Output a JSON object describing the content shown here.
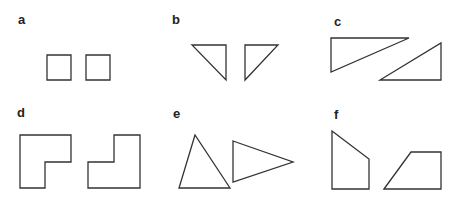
{
  "panels": [
    {
      "label": "a",
      "label_pos": [
        18,
        24
      ],
      "shapes": [
        "47,55 71,55 71,80 47,80",
        "86,55 110,55 110,80 86,80"
      ]
    },
    {
      "label": "b",
      "label_pos": [
        172,
        24
      ],
      "shapes": [
        "192,45 226,45 226,80",
        "245,45 278,45 245,80"
      ]
    },
    {
      "label": "c",
      "label_pos": [
        334,
        26
      ],
      "shapes": [
        "331,38 409,38 331,72",
        "380,80 441,80 441,43"
      ]
    },
    {
      "label": "d",
      "label_pos": [
        17,
        117
      ],
      "shapes": [
        "20,135 71,135 71,162 45,162 45,188 20,188",
        "88,162 114,162 114,135 140,135 140,188 88,188"
      ]
    },
    {
      "label": "e",
      "label_pos": [
        173,
        118
      ],
      "shapes": [
        "195,135 179,188 230,188",
        "233,141 293,162 233,182"
      ]
    },
    {
      "label": "f",
      "label_pos": [
        334,
        119
      ],
      "shapes": [
        "332,131 369,159 369,189 332,189",
        "384,189 411,152 441,152 441,189"
      ]
    }
  ],
  "colors": {
    "stroke": "#333333",
    "label": "#222222",
    "background": "#ffffff"
  }
}
